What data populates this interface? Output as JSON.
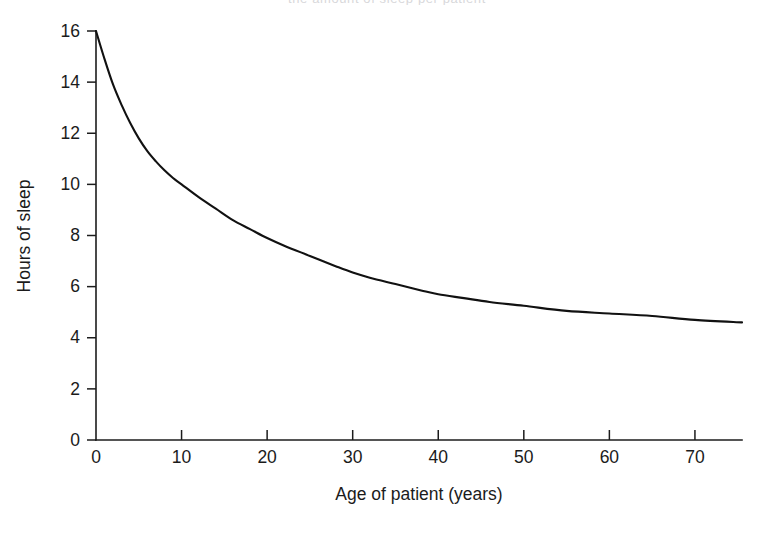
{
  "figure": {
    "background_color": "#ffffff",
    "ink_color": "#111111",
    "top_cropped_caption": "the amount of sleep per patient"
  },
  "chart_data": {
    "type": "line",
    "title": "",
    "subtitle": "",
    "xlabel": "Age of patient (years)",
    "ylabel": "Hours of sleep",
    "xlim": [
      0,
      75.5
    ],
    "ylim": [
      0,
      16
    ],
    "xticks": [
      0,
      10,
      20,
      30,
      40,
      50,
      60,
      70
    ],
    "yticks": [
      0,
      2,
      4,
      6,
      8,
      10,
      12,
      14,
      16
    ],
    "xtick_labels": [
      "0",
      "10",
      "20",
      "30",
      "40",
      "50",
      "60",
      "70"
    ],
    "ytick_labels": [
      "0",
      "2",
      "4",
      "6",
      "8",
      "10",
      "12",
      "14",
      "16"
    ],
    "grid": false,
    "legend": null,
    "legend_position": "none",
    "annotations": [],
    "series": [
      {
        "name": "Hours of sleep",
        "color": "#111111",
        "line_width": 2.1,
        "x": [
          0,
          1,
          2,
          3,
          4,
          5,
          6,
          7,
          8,
          9,
          10,
          12,
          14,
          16,
          18,
          20,
          22,
          25,
          28,
          30,
          32,
          35,
          38,
          40,
          43,
          46,
          50,
          55,
          60,
          65,
          70,
          75.5
        ],
        "y": [
          16.0,
          14.9,
          13.9,
          13.1,
          12.4,
          11.8,
          11.3,
          10.9,
          10.55,
          10.25,
          10.0,
          9.5,
          9.05,
          8.6,
          8.25,
          7.9,
          7.6,
          7.2,
          6.8,
          6.55,
          6.35,
          6.1,
          5.85,
          5.7,
          5.55,
          5.4,
          5.25,
          5.05,
          4.95,
          4.85,
          4.7,
          4.6
        ]
      }
    ]
  }
}
